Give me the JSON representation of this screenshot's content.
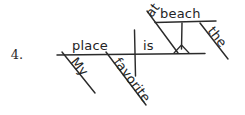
{
  "worksheet": {
    "item_number": "4.",
    "sentence": "My favorite place is at the beach."
  },
  "diagram": {
    "type": "reed-kellogg-sentence-diagram",
    "ink_color": "#2b2b2b",
    "background_color": "#ffffff",
    "words": {
      "subject": "place",
      "verb": "is",
      "subject_modifier_1": "My",
      "subject_modifier_2": "favorite",
      "preposition": "at",
      "object_of_preposition": "beach",
      "object_modifier": "the"
    },
    "labels": {
      "baseline": "main-baseline",
      "subject_verb_divider": "vertical-divider",
      "preposition_slant": "preposition-slant-line",
      "prep_object_line": "prepositional-object-line",
      "angle_mark": "angle-mark"
    }
  }
}
